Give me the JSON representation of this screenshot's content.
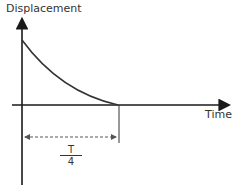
{
  "diagram": {
    "y_axis_label": "Displacement",
    "x_axis_label": "Time",
    "interval_label": {
      "numerator": "T",
      "denominator": "4"
    },
    "curve": "decaying displacement from maximum at t=0 to zero at t=T/4",
    "colors": {
      "axis": "#1a1a1a",
      "curve": "#333333",
      "dashed": "#555555"
    }
  }
}
